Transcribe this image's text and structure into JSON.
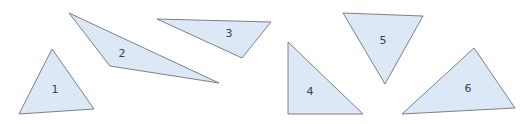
{
  "diagram": {
    "fill_color": "#dce8f5",
    "stroke_color": "#6f7378",
    "triangles": [
      {
        "label": "1",
        "points": "52,49 94,109 19,114",
        "label_pos": [
          55,
          90
        ]
      },
      {
        "label": "2",
        "points": "69,13 219,83 110,66",
        "label_pos": [
          122,
          54
        ]
      },
      {
        "label": "3",
        "points": "157,19 271,22 242,58",
        "label_pos": [
          229,
          34
        ]
      },
      {
        "label": "4",
        "points": "288,42 363,114 288,114",
        "label_pos": [
          310,
          92
        ]
      },
      {
        "label": "5",
        "points": "343,13 423,16 385,84",
        "label_pos": [
          383,
          41
        ]
      },
      {
        "label": "6",
        "points": "474,48 515,108 402,114",
        "label_pos": [
          468,
          89
        ]
      }
    ]
  }
}
